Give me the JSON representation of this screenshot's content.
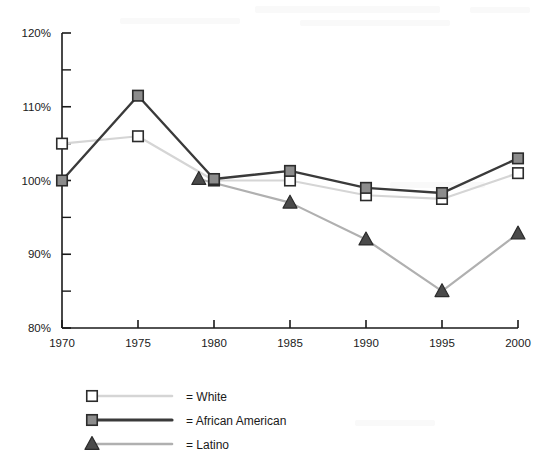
{
  "chart_data": {
    "type": "line",
    "title": "",
    "subtitle": "",
    "xlabel": "",
    "ylabel": "",
    "xlim": [
      1970,
      2000
    ],
    "ylim": [
      80,
      120
    ],
    "grid": false,
    "legend_position": "bottom-left",
    "x_ticks": [
      "1970",
      "1975",
      "1980",
      "1985",
      "1990",
      "1995",
      "2000"
    ],
    "x_tick_values": [
      1970,
      1975,
      1980,
      1985,
      1990,
      1995,
      2000
    ],
    "y_ticks": [
      "80%",
      "90%",
      "100%",
      "110%",
      "120%"
    ],
    "y_tick_values": [
      80,
      90,
      100,
      110,
      120
    ],
    "y_minor_tick_values": [
      85,
      95,
      105,
      115
    ],
    "series": [
      {
        "name": "White",
        "marker": "open-square",
        "line_color": "#d5d5d5",
        "marker_fill": "#ffffff",
        "marker_stroke": "#2b2b2b",
        "x": [
          1970,
          1975,
          1980,
          1985,
          1990,
          1995,
          2000
        ],
        "values": [
          105.0,
          106.0,
          100.0,
          100.0,
          98.0,
          97.5,
          101.0
        ]
      },
      {
        "name": "African American",
        "marker": "filled-square",
        "line_color": "#3a3a3a",
        "marker_fill": "#8c8c8c",
        "marker_stroke": "#2b2b2b",
        "x": [
          1970,
          1975,
          1980,
          1985,
          1990,
          1995,
          2000
        ],
        "values": [
          100.0,
          111.5,
          100.2,
          101.3,
          99.0,
          98.3,
          103.0
        ]
      },
      {
        "name": "Latino",
        "marker": "filled-triangle",
        "line_color": "#b0b0b0",
        "marker_fill": "#4a4a4a",
        "marker_stroke": "#2b2b2b",
        "x": [
          1979,
          1985,
          1990,
          1995,
          2000
        ],
        "values": [
          100.2,
          97.0,
          92.0,
          85.0,
          92.8
        ]
      }
    ]
  },
  "legend": {
    "items": [
      {
        "prefix": "=",
        "label": "White"
      },
      {
        "prefix": "=",
        "label": "African American"
      },
      {
        "prefix": "=",
        "label": "Latino"
      }
    ]
  },
  "colors": {
    "axis": "#1a1a1a",
    "white_series": "#d5d5d5",
    "african_american_series": "#3a3a3a",
    "latino_series": "#b0b0b0",
    "background": "#ffffff"
  }
}
